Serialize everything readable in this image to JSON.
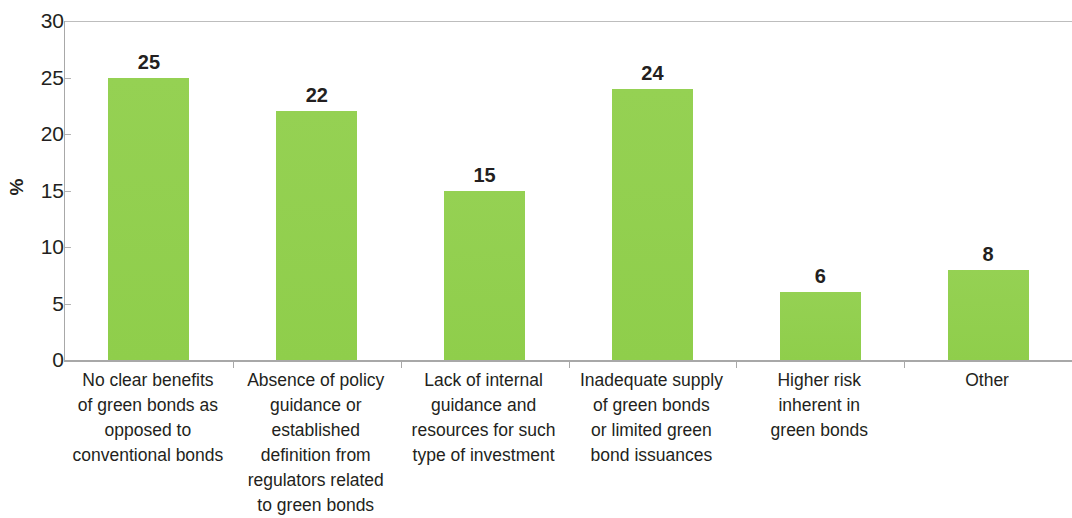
{
  "chart_data": {
    "type": "bar",
    "title": "",
    "subtitle": "",
    "xlabel": "",
    "ylabel": "%",
    "ylim": [
      0,
      30
    ],
    "ytick_labels": [
      "30",
      "25",
      "20",
      "15",
      "10",
      "5",
      "0"
    ],
    "ytick_values": [
      30,
      25,
      20,
      15,
      10,
      5,
      0
    ],
    "grid": false,
    "legend": null,
    "bar_color": "#92d050",
    "categories": [
      "No clear benefits\nof green bonds as\nopposed to\nconventional bonds",
      "Absence of policy\nguidance or\nestablished\ndefinition from\nregulators related\nto green bonds",
      "Lack of internal\nguidance and\nresources for such\ntype of investment",
      "Inadequate supply\nof green bonds\nor limited green\nbond issuances",
      "Higher risk\ninherent in\ngreen bonds",
      "Other"
    ],
    "values": [
      25,
      22,
      15,
      24,
      6,
      8
    ],
    "value_labels": [
      "25",
      "22",
      "15",
      "24",
      "6",
      "8"
    ]
  },
  "axis": {
    "y_title": "%"
  }
}
